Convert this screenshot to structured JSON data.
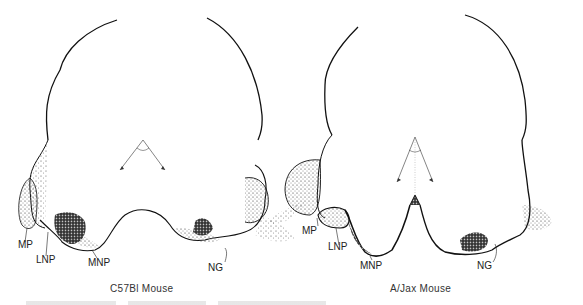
{
  "figure": {
    "panels": [
      {
        "caption": "C57Bl Mouse",
        "labels": {
          "mp": "MP",
          "lnp": "LNP",
          "mnp": "MNP",
          "ng": "NG"
        }
      },
      {
        "caption": "A/Jax Mouse",
        "labels": {
          "mp": "MP",
          "lnp": "LNP",
          "mnp": "MNP",
          "ng": "NG"
        }
      }
    ],
    "colors": {
      "ink": "#111111",
      "paper": "#ffffff"
    }
  }
}
